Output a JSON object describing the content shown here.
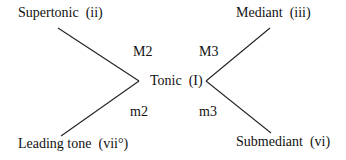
{
  "diagram": {
    "nodes": {
      "tonic": "Tonic  (I)",
      "supertonic": "Supertonic  (ii)",
      "mediant": "Mediant  (iii)",
      "leading_tone": "Leading tone  (vii°)",
      "submediant": "Submediant  (vi)"
    },
    "intervals": {
      "supertonic": "M2",
      "mediant": "M3",
      "leading_tone": "m2",
      "submediant": "m3"
    },
    "colors": {
      "background": "#ffffff",
      "text": "#111111",
      "line": "#222222"
    }
  }
}
